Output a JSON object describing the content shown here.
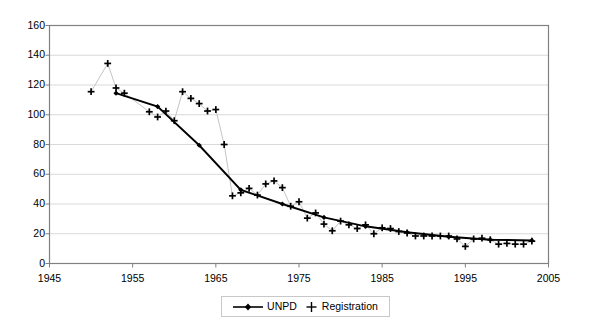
{
  "chart_data": {
    "type": "line",
    "title": "",
    "subtitle": "",
    "xlabel": "",
    "ylabel": "",
    "xlim": [
      1945,
      2005
    ],
    "ylim": [
      0,
      160
    ],
    "xticks": [
      1945,
      1955,
      1965,
      1975,
      1985,
      1995,
      2005
    ],
    "yticks": [
      0,
      20,
      40,
      60,
      80,
      100,
      120,
      140,
      160
    ],
    "grid": "horizontal",
    "legend_position": "bottom-center",
    "series": [
      {
        "name": "UNPD",
        "marker": "filled-diamond",
        "line": "solid-thick",
        "color": "#000000",
        "x": [
          1953,
          1958,
          1963,
          1968,
          1973,
          1978,
          1983,
          1988,
          1993,
          1998,
          2003
        ],
        "values": [
          114.5,
          105.5,
          79.5,
          49.5,
          40.0,
          31.0,
          25.0,
          21.0,
          18.0,
          16.0,
          15.5
        ]
      },
      {
        "name": "Registration",
        "marker": "plus",
        "line": "thin-grey",
        "color": "#000000",
        "x": [
          1950,
          1952,
          1953,
          1954,
          1957,
          1958,
          1959,
          1960,
          1961,
          1962,
          1963,
          1964,
          1965,
          1966,
          1967,
          1968,
          1969,
          1970,
          1971,
          1972,
          1973,
          1974,
          1975,
          1976,
          1977,
          1978,
          1979,
          1980,
          1981,
          1982,
          1983,
          1984,
          1985,
          1986,
          1987,
          1988,
          1989,
          1990,
          1991,
          1992,
          1993,
          1994,
          1995,
          1996,
          1997,
          1998,
          1999,
          2000,
          2001,
          2002,
          2003
        ],
        "values": [
          115.5,
          134.5,
          118.0,
          114.5,
          102.0,
          98.5,
          102.5,
          96.0,
          115.5,
          111.0,
          107.5,
          102.5,
          103.5,
          80.0,
          45.5,
          47.5,
          50.5,
          46.0,
          53.5,
          55.5,
          51.0,
          38.5,
          41.5,
          30.5,
          34.0,
          26.5,
          22.0,
          28.5,
          26.0,
          23.5,
          26.0,
          20.0,
          24.0,
          23.5,
          21.5,
          20.5,
          18.5,
          18.5,
          18.5,
          18.5,
          18.5,
          16.5,
          11.5,
          16.5,
          17.0,
          16.0,
          13.0,
          13.5,
          13.0,
          13.0,
          15.0
        ]
      }
    ]
  },
  "legend": {
    "items": [
      {
        "label": "UNPD"
      },
      {
        "label": "Registration"
      }
    ]
  },
  "axes": {
    "y_tick_labels": [
      "160",
      "140",
      "120",
      "100",
      "80",
      "60",
      "40",
      "20",
      "0"
    ],
    "x_tick_labels": [
      "1945",
      "1955",
      "1965",
      "1975",
      "1985",
      "1995",
      "2005"
    ]
  }
}
